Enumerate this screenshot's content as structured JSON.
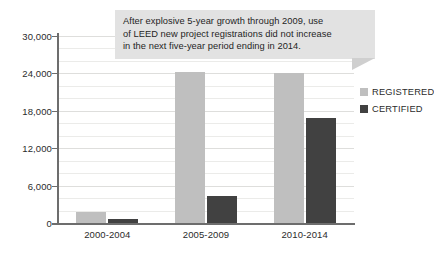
{
  "chart_data": {
    "type": "bar",
    "title": "",
    "xlabel": "",
    "ylabel": "",
    "categories": [
      "2000-2004",
      "2005-2009",
      "2010-2014"
    ],
    "series": [
      {
        "name": "REGISTERED",
        "color": "#bfbfbf",
        "values": [
          1800,
          24200,
          24000
        ]
      },
      {
        "name": "CERTIFIED",
        "color": "#414141",
        "values": [
          700,
          4300,
          16900
        ]
      }
    ],
    "ylim": [
      0,
      30000
    ],
    "yticks": [
      0,
      6000,
      12000,
      18000,
      24000,
      30000
    ],
    "ytick_labels": [
      "0",
      "6,000",
      "12,000",
      "18,000",
      "24,000",
      "30,000"
    ],
    "grid": true,
    "legend_position": "right",
    "annotations": [
      {
        "name": "callout",
        "lines": [
          "After explosive 5-year growth through 2009, use",
          "of LEED new project registrations did not increase",
          "in the next five-year period ending in 2014."
        ]
      }
    ]
  },
  "legend": {
    "items": [
      {
        "label": "REGISTERED",
        "color": "#bfbfbf"
      },
      {
        "label": "CERTIFIED",
        "color": "#414141"
      }
    ]
  },
  "colors": {
    "registered": "#bfbfbf",
    "certified": "#414141",
    "callout_background": "#e2e2e2",
    "axis": "#6d6d6d",
    "gridline": "#dededc",
    "text": "#2b2b2b"
  }
}
